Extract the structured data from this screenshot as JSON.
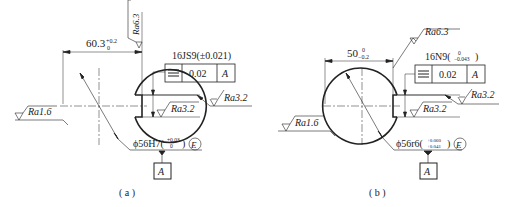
{
  "figures": [
    {
      "id": "a",
      "caption": "( a )",
      "width_dim": {
        "base": "60.3",
        "upper": "+0.2",
        "lower": "0"
      },
      "keyway_tol": "16JS9(±0.021)",
      "fcf": {
        "symbol": "symmetry",
        "value": "0.02",
        "datum": "A"
      },
      "roughness": {
        "top": "Ra6.3",
        "left": "Ra1.6",
        "right_outer": "Ra3.2",
        "right_inner": "Ra3.2"
      },
      "bore": {
        "base": "ϕ56H7(",
        "upper": "+0.03",
        "lower": "0",
        "close": ")",
        "envelope": "E"
      },
      "datum_label": "A"
    },
    {
      "id": "b",
      "caption": "( b )",
      "width_dim": {
        "base": "50",
        "upper": "0",
        "lower": "−0.2"
      },
      "keyway_tol": {
        "base": "16N9(",
        "upper": "0",
        "lower": "−0.043",
        "close": ")"
      },
      "fcf": {
        "symbol": "symmetry",
        "value": "0.02",
        "datum": "A"
      },
      "roughness": {
        "top": "Ra6.3",
        "left": "Ra1.6",
        "right_outer": "Ra3.2",
        "right_inner": "Ra3.2"
      },
      "bore": {
        "base": "ϕ56r6(",
        "upper": "+0.060",
        "lower": "+0.041",
        "close": ")",
        "envelope": "E"
      },
      "datum_label": "A"
    }
  ]
}
